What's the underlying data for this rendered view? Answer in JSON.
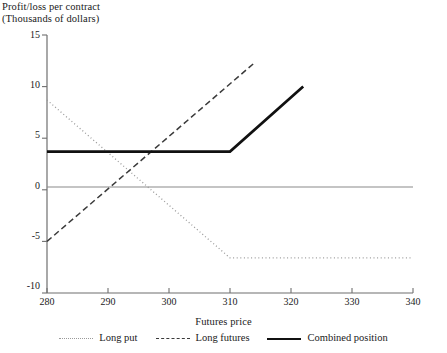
{
  "chart_data": {
    "type": "line",
    "title": "",
    "ylabel": "Profit/loss per contract\n(Thousands of dollars)",
    "ylabel_line1": "Profit/loss per contract",
    "ylabel_line2": "(Thousands of dollars)",
    "xlabel": "Futures price",
    "xlim": [
      280,
      340
    ],
    "ylim": [
      -10,
      15
    ],
    "xticks": [
      280,
      290,
      300,
      310,
      320,
      330,
      340
    ],
    "yticks": [
      15,
      10,
      5,
      0,
      -5,
      -10
    ],
    "grid": false,
    "zero_line": true,
    "legend_position": "bottom-center",
    "series": [
      {
        "name": "Long put",
        "style": "dotted",
        "color": "#9a9a9a",
        "x": [
          280,
          310,
          340
        ],
        "y": [
          8.7,
          -6.6,
          -6.6
        ]
      },
      {
        "name": "Long futures",
        "style": "dashed",
        "color": "#3a3a3a",
        "x": [
          280,
          314
        ],
        "y": [
          -5.0,
          12.3
        ]
      },
      {
        "name": "Combined position",
        "style": "solid",
        "color": "#111111",
        "x": [
          280,
          310,
          322
        ],
        "y": [
          3.7,
          3.7,
          10.0
        ]
      }
    ],
    "annotations": []
  },
  "legend": {
    "items": [
      {
        "label": "Long put",
        "swatch": "dotted-line-swatch"
      },
      {
        "label": "Long futures",
        "swatch": "dashed-line-swatch"
      },
      {
        "label": "Combined position",
        "swatch": "solid-line-swatch"
      }
    ]
  },
  "axis_titles": {
    "y_line1": "Profit/loss per contract",
    "y_line2": "(Thousands of dollars)",
    "x": "Futures price"
  },
  "tick_labels": {
    "y": [
      "15",
      "10",
      "5",
      "0",
      "-5",
      "-10"
    ],
    "x": [
      "280",
      "290",
      "300",
      "310",
      "320",
      "330",
      "340"
    ]
  }
}
